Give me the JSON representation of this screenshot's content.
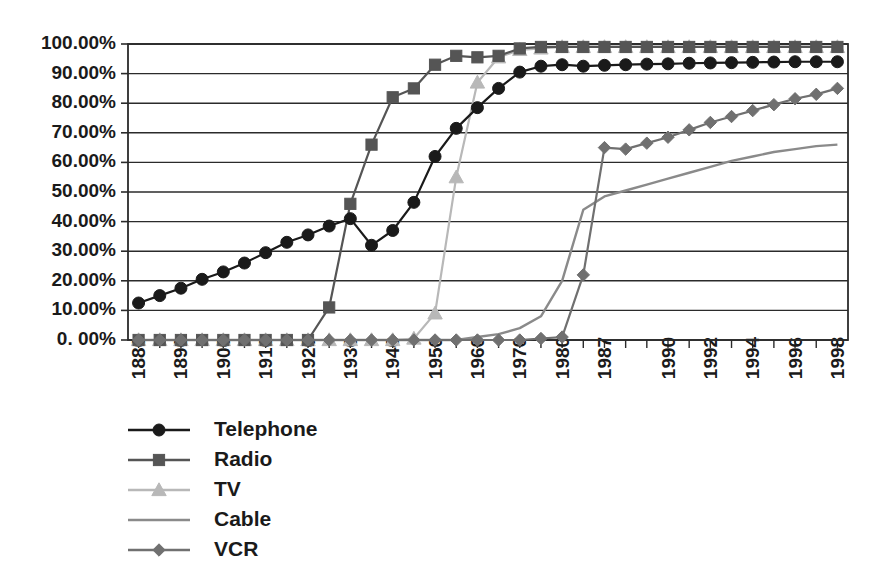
{
  "chart_data": {
    "type": "line",
    "title": "",
    "subtitle": "",
    "xlabel": "",
    "ylabel": "",
    "ylim": [
      0,
      1.0
    ],
    "grid": true,
    "legend_position": "bottom-left",
    "y_tick_labels": [
      "100.00%",
      "90.00%",
      "80.00%",
      "70.00%",
      "60.00%",
      "50.00%",
      "40.00%",
      "30.00%",
      "20.00%",
      "10.00%",
      "0. 00%"
    ],
    "y_tick_values": [
      100,
      90,
      80,
      70,
      60,
      50,
      40,
      30,
      20,
      10,
      0
    ],
    "categories": [
      "1880",
      "1885",
      "1890",
      "1895",
      "1900",
      "1905",
      "1910",
      "1915",
      "1920",
      "1925",
      "1930",
      "1935",
      "1940",
      "1945",
      "1950",
      "1955",
      "1960",
      "1965",
      "1970",
      "1975",
      "1980",
      "1985",
      "1987",
      "1988",
      "1989",
      "1990",
      "1991",
      "1992",
      "1993",
      "1994",
      "1995",
      "1996",
      "1997",
      "1998"
    ],
    "x_tick_labels": [
      "1880",
      "",
      "1890",
      "",
      "1900",
      "",
      "1910",
      "",
      "1920",
      "",
      "1930",
      "",
      "1940",
      "",
      "1950",
      "",
      "1960",
      "",
      "1970",
      "",
      "1980",
      "",
      "1987",
      "",
      "",
      "1990",
      "",
      "1992",
      "",
      "1994",
      "",
      "1996",
      "",
      "1998"
    ],
    "series": [
      {
        "name": "Telephone",
        "color": "#1a1a1a",
        "marker": "circle",
        "values": [
          12.5,
          15.0,
          17.5,
          20.5,
          23.0,
          26.0,
          29.5,
          33.0,
          35.5,
          38.5,
          41.0,
          32.0,
          37.0,
          46.5,
          62.0,
          71.5,
          78.5,
          85.0,
          90.5,
          92.5,
          93.0,
          92.5,
          92.8,
          93.0,
          93.2,
          93.3,
          93.5,
          93.6,
          93.7,
          93.8,
          93.9,
          94.0,
          94.0,
          94.0
        ]
      },
      {
        "name": "Radio",
        "color": "#555555",
        "marker": "square",
        "values": [
          0,
          0,
          0,
          0,
          0,
          0,
          0,
          0,
          0,
          11.0,
          46.0,
          66.0,
          82.0,
          85.0,
          93.0,
          96.0,
          95.5,
          96.0,
          98.5,
          99.0,
          99.0,
          99.0,
          99.0,
          99.0,
          99.0,
          99.0,
          99.0,
          99.0,
          99.0,
          99.0,
          99.0,
          99.0,
          99.0,
          99.0
        ]
      },
      {
        "name": "TV",
        "color": "#b8b8b8",
        "marker": "triangle",
        "values": [
          0,
          0,
          0,
          0,
          0,
          0,
          0,
          0,
          0,
          0,
          0,
          0,
          0,
          0.5,
          9.0,
          55.0,
          87.0,
          95.5,
          98.0,
          98.5,
          99.0,
          99.0,
          99.0,
          99.0,
          99.0,
          99.0,
          99.0,
          99.0,
          99.0,
          99.0,
          99.0,
          99.0,
          99.0,
          99.0
        ]
      },
      {
        "name": "Cable",
        "color": "#8a8a8a",
        "marker": "none",
        "values": [
          0,
          0,
          0,
          0,
          0,
          0,
          0,
          0,
          0,
          0,
          0,
          0,
          0,
          0,
          0,
          0,
          1.0,
          2.0,
          4.0,
          8.0,
          20.0,
          44.0,
          48.5,
          50.5,
          52.5,
          54.5,
          56.5,
          58.5,
          60.5,
          62.0,
          63.5,
          64.5,
          65.5,
          66.0
        ]
      },
      {
        "name": "VCR",
        "color": "#707070",
        "marker": "diamond",
        "values": [
          0,
          0,
          0,
          0,
          0,
          0,
          0,
          0,
          0,
          0,
          0,
          0,
          0,
          0,
          0,
          0,
          0,
          0,
          0,
          0.5,
          1.0,
          22.0,
          65.0,
          64.5,
          66.5,
          68.5,
          71.0,
          73.5,
          75.5,
          77.5,
          79.5,
          81.5,
          83.0,
          85.0
        ]
      }
    ]
  },
  "legend": {
    "items": [
      {
        "label": "Telephone"
      },
      {
        "label": "Radio"
      },
      {
        "label": "TV"
      },
      {
        "label": "Cable"
      },
      {
        "label": "VCR"
      }
    ]
  }
}
